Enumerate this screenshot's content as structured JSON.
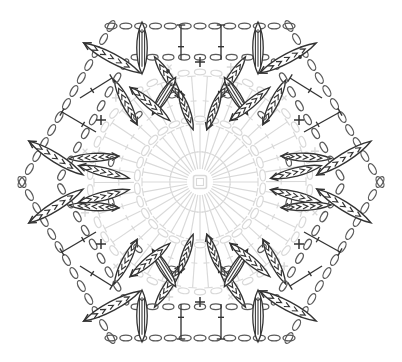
{
  "document": {
    "title": "Crochet Hexagon Motif Chart",
    "kind": "crochet-stitch-diagram",
    "shape": "hexagon",
    "background_color": "#ffffff",
    "width": 402,
    "height": 362
  },
  "palette": {
    "dark": "#333333",
    "mid": "#5a5a5a",
    "light": "#d9d9d9",
    "pale": "#e6e6e6",
    "white": "#ffffff"
  },
  "geometry": {
    "center": {
      "x": 200,
      "y": 182
    },
    "hex_flat_radius": 158,
    "hex_orientation": "pointy-left-right",
    "vertices": [
      {
        "x": 22,
        "y": 182
      },
      {
        "x": 111,
        "y": 26
      },
      {
        "x": 289,
        "y": 26
      },
      {
        "x": 380,
        "y": 182
      },
      {
        "x": 289,
        "y": 338
      },
      {
        "x": 111,
        "y": 338
      }
    ]
  },
  "legend_symbols": [
    {
      "name": "chain-stitch",
      "glyph": "oval",
      "meaning": "chain"
    },
    {
      "name": "single-crochet",
      "glyph": "plus",
      "meaning": "single crochet"
    },
    {
      "name": "slip-stitch",
      "glyph": "dot",
      "meaning": "slip stitch"
    },
    {
      "name": "treble-crochet",
      "glyph": "bar-with-tick",
      "meaning": "treble crochet"
    },
    {
      "name": "puff-stitch",
      "glyph": "vertical-ellipse-filled",
      "meaning": "puff / bobble"
    },
    {
      "name": "bullion-cluster",
      "glyph": "angled-ellipse-with-chevrons",
      "meaning": "bullion cluster"
    }
  ],
  "rounds": [
    {
      "index": 1,
      "name": "magic-ring",
      "color_key": "light",
      "description": "central square magic ring",
      "ring_square_size": 13
    },
    {
      "index": 2,
      "name": "inner-treble-fan",
      "color_key": "light",
      "radius_inner": 13,
      "radius_outer": 58,
      "count": 36,
      "description": "radiating treble crochet posts with T tops"
    },
    {
      "index": 3,
      "name": "inner-chain-ring",
      "color_key": "light",
      "radius": 63,
      "count": 30,
      "description": "ring of chain ovals"
    },
    {
      "index": 4,
      "name": "mid-treble-fan",
      "color_key": "light",
      "radius_inner": 66,
      "radius_outer": 106,
      "count": 42,
      "description": "second radiating treble round"
    },
    {
      "index": 5,
      "name": "mid-chain-ring",
      "color_key": "light",
      "radius": 110,
      "count": 42,
      "description": "ring of chain ovals with plus marks at corners"
    },
    {
      "index": 6,
      "name": "bullion-cluster-round",
      "color_key": "dark",
      "radius": 112,
      "count": 24,
      "description": "angled bullion clusters in pairs around the motif"
    },
    {
      "index": 7,
      "name": "outer-hex-chain-edge",
      "color_key": "mid",
      "description": "hexagon perimeter of chain ovals"
    },
    {
      "index": 8,
      "name": "outer-puff-row",
      "color_key": "dark",
      "count": 12,
      "description": "puff stitches along top and bottom edges"
    },
    {
      "index": 9,
      "name": "outer-treble-row",
      "color_key": "dark",
      "count": 16,
      "description": "treble posts with T tops on the outer edges"
    },
    {
      "index": 10,
      "name": "outer-bullion-round",
      "color_key": "dark",
      "count": 12,
      "description": "long angled bullion clusters near hexagon vertices"
    }
  ],
  "marks": {
    "plus_positions": [
      {
        "x": 200,
        "y": 62,
        "color_key": "dark"
      },
      {
        "x": 200,
        "y": 302,
        "color_key": "dark"
      },
      {
        "x": 101,
        "y": 120,
        "color_key": "dark"
      },
      {
        "x": 299,
        "y": 120,
        "color_key": "dark"
      },
      {
        "x": 101,
        "y": 244,
        "color_key": "dark"
      },
      {
        "x": 299,
        "y": 244,
        "color_key": "dark"
      }
    ],
    "dot_positions": [
      {
        "x": 168,
        "y": 71,
        "color_key": "dark"
      },
      {
        "x": 300,
        "y": 57,
        "color_key": "dark"
      }
    ]
  },
  "chart_data": {
    "type": "diagram",
    "title": "Crochet Hexagon Motif Chart",
    "symbol_counts": {
      "chain-oval-outer-edge": 72,
      "chain-oval-inner-rings": 72,
      "puff-stitch": 12,
      "treble-crochet": 94,
      "bullion-cluster": 36,
      "single-crochet-plus": 18,
      "slip-stitch-dot": 2
    },
    "rounds_total": 10,
    "sides": 6
  }
}
